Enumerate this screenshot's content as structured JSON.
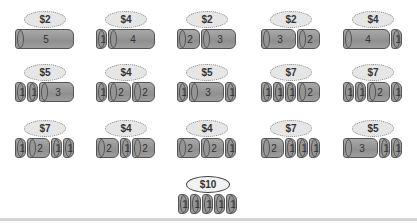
{
  "colors": {
    "rod": "#9a9a9a",
    "rod_border": "#555555",
    "bubble": "#e6e6e6",
    "divider": "#d4d4d4"
  },
  "rows": [
    [
      {
        "price": "$2",
        "pieces": [
          5
        ]
      },
      {
        "price": "$4",
        "pieces": [
          1,
          4
        ]
      },
      {
        "price": "$2",
        "pieces": [
          2,
          3
        ]
      },
      {
        "price": "$2",
        "pieces": [
          3,
          2
        ]
      },
      {
        "price": "$4",
        "pieces": [
          4,
          1
        ]
      }
    ],
    [
      {
        "price": "$5",
        "pieces": [
          1,
          1,
          3
        ]
      },
      {
        "price": "$4",
        "pieces": [
          1,
          2,
          2
        ]
      },
      {
        "price": "$5",
        "pieces": [
          1,
          3,
          1
        ]
      },
      {
        "price": "$7",
        "pieces": [
          1,
          1,
          1,
          2
        ]
      },
      {
        "price": "$7",
        "pieces": [
          1,
          1,
          2,
          1
        ]
      }
    ],
    [
      {
        "price": "$7",
        "pieces": [
          1,
          2,
          1,
          1
        ]
      },
      {
        "price": "$4",
        "pieces": [
          2,
          1,
          2
        ]
      },
      {
        "price": "$4",
        "pieces": [
          2,
          2,
          1
        ]
      },
      {
        "price": "$7",
        "pieces": [
          2,
          1,
          1,
          1
        ]
      },
      {
        "price": "$5",
        "pieces": [
          3,
          1,
          1
        ]
      }
    ],
    [
      {
        "price": "$10",
        "pieces": [
          1,
          1,
          1,
          1,
          1
        ],
        "best": true
      }
    ]
  ]
}
